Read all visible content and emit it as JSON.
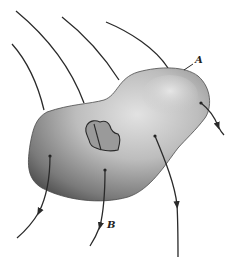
{
  "diagram": {
    "labels": {
      "point_a": "A",
      "point_b": "B"
    },
    "elements": {
      "body": "irregular-closed-surface",
      "hole": "interior-cavity",
      "streamlines_count": 6
    },
    "colors": {
      "body_dark": "#5a5a5a",
      "body_light": "#d8d8d8",
      "line": "#2a2a2a",
      "hole_fill": "#9a9a9a"
    }
  }
}
